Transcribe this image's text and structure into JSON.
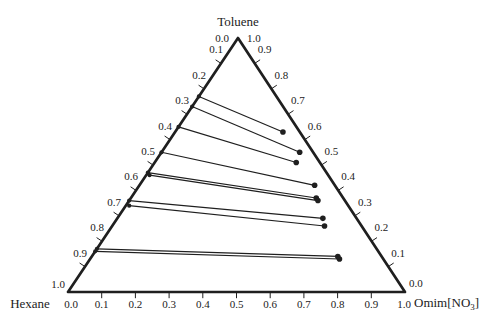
{
  "figure": {
    "background": "#ffffff",
    "ink": "#1f1f1f"
  },
  "chart_data": {
    "type": "ternary-tie-lines",
    "title": "",
    "components": {
      "top": "Toluene",
      "bottom_left": "Hexane",
      "bottom_right": "Omim[NO3]",
      "bottom_right_parts": {
        "pre": "Omim[NO",
        "sub": "3",
        "post": "]"
      }
    },
    "axes": {
      "tick_step": 0.1,
      "left_edge": {
        "component": "Hexane",
        "direction": "top-to-bottom",
        "range": [
          0.0,
          1.0
        ],
        "tick_labels": [
          "0.0",
          "0.1",
          "0.2",
          "0.3",
          "0.4",
          "0.5",
          "0.6",
          "0.7",
          "0.8",
          "0.9",
          "1.0"
        ]
      },
      "right_edge": {
        "component": "Toluene",
        "direction": "top-to-bottom",
        "range": [
          1.0,
          0.0
        ],
        "tick_labels": [
          "1.0",
          "0.9",
          "0.8",
          "0.7",
          "0.6",
          "0.5",
          "0.4",
          "0.3",
          "0.2",
          "0.1",
          "0.0"
        ]
      },
      "bottom_edge": {
        "component": "Omim[NO3]",
        "direction": "left-to-right",
        "range": [
          0.0,
          1.0
        ],
        "tick_labels": [
          "0.0",
          "0.1",
          "0.2",
          "0.3",
          "0.4",
          "0.5",
          "0.6",
          "0.7",
          "0.8",
          "0.9",
          "1.0"
        ]
      }
    },
    "tie_lines": [
      {
        "left": {
          "hexane": 0.23,
          "toluene": 0.77,
          "omim_no3": 0.0
        },
        "right": {
          "hexane": 0.05,
          "toluene": 0.63,
          "omim_no3": 0.32
        }
      },
      {
        "left": {
          "hexane": 0.27,
          "toluene": 0.73,
          "omim_no3": 0.0
        },
        "right": {
          "hexane": 0.04,
          "toluene": 0.55,
          "omim_no3": 0.41
        }
      },
      {
        "left": {
          "hexane": 0.35,
          "toluene": 0.65,
          "omim_no3": 0.0
        },
        "right": {
          "hexane": 0.07,
          "toluene": 0.51,
          "omim_no3": 0.42
        }
      },
      {
        "left": {
          "hexane": 0.45,
          "toluene": 0.55,
          "omim_no3": 0.0
        },
        "right": {
          "hexane": 0.06,
          "toluene": 0.42,
          "omim_no3": 0.52
        }
      },
      {
        "left": {
          "hexane": 0.53,
          "toluene": 0.47,
          "omim_no3": 0.0
        },
        "right": {
          "hexane": 0.08,
          "toluene": 0.37,
          "omim_no3": 0.55
        }
      },
      {
        "left": {
          "hexane": 0.53,
          "toluene": 0.46,
          "omim_no3": 0.01
        },
        "right": {
          "hexane": 0.08,
          "toluene": 0.36,
          "omim_no3": 0.56
        }
      },
      {
        "left": {
          "hexane": 0.64,
          "toluene": 0.36,
          "omim_no3": 0.0
        },
        "right": {
          "hexane": 0.1,
          "toluene": 0.29,
          "omim_no3": 0.61
        }
      },
      {
        "left": {
          "hexane": 0.65,
          "toluene": 0.34,
          "omim_no3": 0.01
        },
        "right": {
          "hexane": 0.11,
          "toluene": 0.26,
          "omim_no3": 0.63
        }
      },
      {
        "left": {
          "hexane": 0.83,
          "toluene": 0.17,
          "omim_no3": 0.0
        },
        "right": {
          "hexane": 0.13,
          "toluene": 0.14,
          "omim_no3": 0.73
        }
      },
      {
        "left": {
          "hexane": 0.84,
          "toluene": 0.16,
          "omim_no3": 0.0
        },
        "right": {
          "hexane": 0.13,
          "toluene": 0.13,
          "omim_no3": 0.74
        }
      }
    ]
  }
}
